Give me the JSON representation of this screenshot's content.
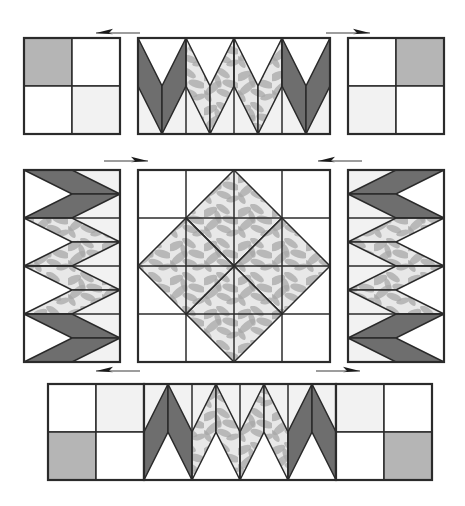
{
  "diagram": {
    "type": "quilt-block-assembly",
    "canvas": {
      "width": 465,
      "height": 506
    },
    "palette": {
      "dark_fabric": "#6e6e6e",
      "print_fabric": "#e8e8e8",
      "print_motif": "#a8a8a8",
      "medium_gray_fabric": "#b5b5b5",
      "light_fabric": "#f2f2f2",
      "white_fabric": "#ffffff",
      "outline": "#2b2b2b",
      "arrow": "#1a1a1a",
      "background": "#ffffff"
    },
    "stroke": {
      "outer": 2.2,
      "inner": 1.5
    },
    "rows": [
      {
        "name": "top-row",
        "label": "Top assembly row",
        "units": [
          {
            "name": "top-left-corner-unit",
            "kind": "four-patch",
            "x": 24,
            "y": 38,
            "w": 96,
            "h": 96,
            "cells": [
              {
                "name": "cell-top-left",
                "fill": "medium_gray_fabric"
              },
              {
                "name": "cell-top-right",
                "fill": "white_fabric"
              },
              {
                "name": "cell-bottom-left",
                "fill": "white_fabric"
              },
              {
                "name": "cell-bottom-right",
                "fill": "light_fabric"
              }
            ]
          },
          {
            "name": "top-center-chevron-unit",
            "kind": "chevron-strip",
            "x": 138,
            "y": 38,
            "w": 192,
            "h": 96,
            "columns": 4,
            "chevrons": [
              {
                "name": "chevron-1",
                "fill": "dark_fabric",
                "direction": "down"
              },
              {
                "name": "chevron-2",
                "fill": "print_fabric",
                "direction": "down"
              },
              {
                "name": "chevron-3",
                "fill": "print_fabric",
                "direction": "down"
              },
              {
                "name": "chevron-4",
                "fill": "dark_fabric",
                "direction": "down"
              }
            ]
          },
          {
            "name": "top-right-corner-unit",
            "kind": "four-patch",
            "x": 348,
            "y": 38,
            "w": 96,
            "h": 96,
            "cells": [
              {
                "name": "cell-top-left",
                "fill": "white_fabric"
              },
              {
                "name": "cell-top-right",
                "fill": "medium_gray_fabric"
              },
              {
                "name": "cell-bottom-left",
                "fill": "light_fabric"
              },
              {
                "name": "cell-bottom-right",
                "fill": "white_fabric"
              }
            ]
          }
        ],
        "arrows": [
          {
            "name": "arrow-top-left",
            "direction": "left",
            "x": 96,
            "y": 33,
            "length": 44
          },
          {
            "name": "arrow-top-right",
            "direction": "right",
            "x": 326,
            "y": 33,
            "length": 44
          }
        ]
      },
      {
        "name": "middle-row",
        "label": "Middle assembly row",
        "units": [
          {
            "name": "middle-left-chevron-unit",
            "kind": "chevron-column",
            "x": 24,
            "y": 170,
            "w": 96,
            "h": 192,
            "rows": 4,
            "chevrons": [
              {
                "name": "chevron-1",
                "fill": "dark_fabric",
                "direction": "right"
              },
              {
                "name": "chevron-2",
                "fill": "print_fabric",
                "direction": "right"
              },
              {
                "name": "chevron-3",
                "fill": "print_fabric",
                "direction": "right"
              },
              {
                "name": "chevron-4",
                "fill": "dark_fabric",
                "direction": "right"
              }
            ]
          },
          {
            "name": "center-star-block",
            "kind": "eight-pointed-star",
            "x": 138,
            "y": 170,
            "w": 192,
            "h": 192,
            "grid": 4,
            "points": [
              {
                "name": "star-point-n",
                "fill": "print_fabric"
              },
              {
                "name": "star-point-ne",
                "fill": "dark_fabric"
              },
              {
                "name": "star-point-e",
                "fill": "print_fabric"
              },
              {
                "name": "star-point-se",
                "fill": "dark_fabric"
              },
              {
                "name": "star-point-s",
                "fill": "print_fabric"
              },
              {
                "name": "star-point-sw",
                "fill": "dark_fabric"
              },
              {
                "name": "star-point-w",
                "fill": "print_fabric"
              },
              {
                "name": "star-point-nw",
                "fill": "dark_fabric"
              }
            ],
            "corner_squares": "white_fabric",
            "side_triangles": "white_fabric"
          },
          {
            "name": "middle-right-chevron-unit",
            "kind": "chevron-column",
            "x": 348,
            "y": 170,
            "w": 96,
            "h": 192,
            "rows": 4,
            "chevrons": [
              {
                "name": "chevron-1",
                "fill": "dark_fabric",
                "direction": "left"
              },
              {
                "name": "chevron-2",
                "fill": "print_fabric",
                "direction": "left"
              },
              {
                "name": "chevron-3",
                "fill": "print_fabric",
                "direction": "left"
              },
              {
                "name": "chevron-4",
                "fill": "dark_fabric",
                "direction": "left"
              }
            ]
          }
        ],
        "arrows": [
          {
            "name": "arrow-middle-left",
            "direction": "right",
            "x": 104,
            "y": 161,
            "length": 44
          },
          {
            "name": "arrow-middle-right",
            "direction": "left",
            "x": 318,
            "y": 161,
            "length": 44
          }
        ]
      },
      {
        "name": "bottom-row",
        "label": "Bottom assembly row",
        "units": [
          {
            "name": "bottom-left-corner-unit",
            "kind": "four-patch",
            "x": 48,
            "y": 384,
            "w": 96,
            "h": 96,
            "cells": [
              {
                "name": "cell-top-left",
                "fill": "white_fabric"
              },
              {
                "name": "cell-top-right",
                "fill": "light_fabric"
              },
              {
                "name": "cell-bottom-left",
                "fill": "medium_gray_fabric"
              },
              {
                "name": "cell-bottom-right",
                "fill": "white_fabric"
              }
            ]
          },
          {
            "name": "bottom-center-chevron-unit",
            "kind": "chevron-strip",
            "x": 144,
            "y": 384,
            "w": 192,
            "h": 96,
            "columns": 4,
            "chevrons": [
              {
                "name": "chevron-1",
                "fill": "dark_fabric",
                "direction": "up"
              },
              {
                "name": "chevron-2",
                "fill": "print_fabric",
                "direction": "up"
              },
              {
                "name": "chevron-3",
                "fill": "print_fabric",
                "direction": "up"
              },
              {
                "name": "chevron-4",
                "fill": "dark_fabric",
                "direction": "up"
              }
            ]
          },
          {
            "name": "bottom-right-corner-unit",
            "kind": "four-patch",
            "x": 336,
            "y": 384,
            "w": 96,
            "h": 96,
            "cells": [
              {
                "name": "cell-top-left",
                "fill": "light_fabric"
              },
              {
                "name": "cell-top-right",
                "fill": "white_fabric"
              },
              {
                "name": "cell-bottom-left",
                "fill": "white_fabric"
              },
              {
                "name": "cell-bottom-right",
                "fill": "medium_gray_fabric"
              }
            ]
          }
        ],
        "arrows": [
          {
            "name": "arrow-bottom-left",
            "direction": "left",
            "x": 96,
            "y": 371,
            "length": 44
          },
          {
            "name": "arrow-bottom-right",
            "direction": "right",
            "x": 316,
            "y": 371,
            "length": 44
          }
        ]
      }
    ]
  }
}
